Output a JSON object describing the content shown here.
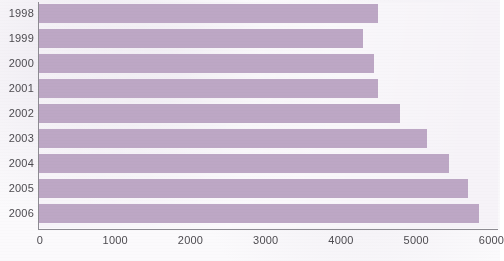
{
  "chart_data": {
    "type": "bar",
    "orientation": "horizontal",
    "title": "",
    "subtitle": "",
    "xlabel": "",
    "ylabel": "",
    "categories": [
      "1998",
      "1999",
      "2000",
      "2001",
      "2002",
      "2003",
      "2004",
      "2005",
      "2006"
    ],
    "values": [
      4500,
      4300,
      4450,
      4500,
      4800,
      5150,
      5450,
      5700,
      5850
    ],
    "series": [
      {
        "name": "",
        "values": [
          4500,
          4300,
          4450,
          4500,
          4800,
          5150,
          5450,
          5700,
          5850
        ]
      }
    ],
    "xlim": [
      0,
      6100
    ],
    "ylim": [
      0,
      9
    ],
    "x_ticks": [
      0,
      1000,
      2000,
      3000,
      4000,
      5000,
      6000
    ],
    "x_tick_labels": [
      "0",
      "1000",
      "2000",
      "3000",
      "4000",
      "5000",
      "6000"
    ],
    "y_tick_labels": [
      "1998",
      "1999",
      "2000",
      "2001",
      "2002",
      "2003",
      "2004",
      "2005",
      "2006"
    ],
    "grid": false,
    "legend": null,
    "legend_position": "none",
    "annotations": [],
    "colors": {
      "bar": "#bda7c5",
      "plot_background": "#f6f3f8",
      "page_background": "#fbfafc",
      "axis_line": "#8d8b92",
      "tick_label": "#4d4b50"
    }
  }
}
